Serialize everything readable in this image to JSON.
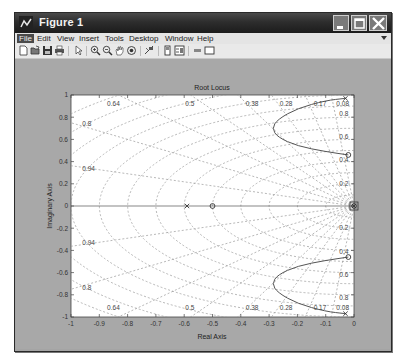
{
  "window": {
    "title": "Figure 1",
    "controls": {
      "minimize": "minimize-icon",
      "maximize": "maximize-icon",
      "close": "close-icon"
    }
  },
  "menubar": {
    "items": [
      {
        "label": "File"
      },
      {
        "label": "Edit"
      },
      {
        "label": "View"
      },
      {
        "label": "Insert"
      },
      {
        "label": "Tools"
      },
      {
        "label": "Desktop"
      },
      {
        "label": "Window"
      },
      {
        "label": "Help"
      }
    ]
  },
  "toolbar": {
    "buttons": [
      "new-figure-icon",
      "open-file-icon",
      "save-icon",
      "print-icon",
      "edit-plot-arrow-icon",
      "zoom-in-icon",
      "zoom-out-icon",
      "pan-hand-icon",
      "rotate-3d-icon",
      "data-cursor-icon",
      "colorbar-icon",
      "legend-icon",
      "hide-plot-tools-icon",
      "show-plot-tools-icon"
    ]
  },
  "chart_data": {
    "type": "scatter",
    "title": "Root Locus",
    "xlabel": "Real Axis",
    "ylabel": "Imaginary Axis",
    "xlim": [
      -1,
      0
    ],
    "ylim": [
      -1,
      1
    ],
    "x_ticks": [
      "-1",
      "-0.9",
      "-0.8",
      "-0.7",
      "-0.6",
      "-0.5",
      "-0.4",
      "-0.3",
      "-0.2",
      "-0.1",
      "0"
    ],
    "y_ticks": [
      "1",
      "0.8",
      "0.6",
      "0.4",
      "0.2",
      "0",
      "-0.2",
      "-0.4",
      "-0.6",
      "-0.8",
      "-1"
    ],
    "grid": true,
    "damping_labels_top": [
      "0.64",
      "0.5",
      "0.38",
      "0.28",
      "0.17",
      "0.08"
    ],
    "damping_labels_bottom": [
      "0.64",
      "0.5",
      "0.38",
      "0.28",
      "0.17",
      "0.08"
    ],
    "damping_labels_left": [
      "0.8",
      "0.94",
      "-0.94",
      "0.8"
    ],
    "frequency_labels_right": [
      "0.8",
      "0.6",
      "0.4",
      "0.2",
      "0.2",
      "0.4",
      "0.6",
      "0.8"
    ],
    "poles": [
      {
        "re": -0.59,
        "im": 0
      },
      {
        "re": -0.03,
        "im": 0.97
      },
      {
        "re": -0.03,
        "im": -0.97
      },
      {
        "re": 0,
        "im": 0
      }
    ],
    "zeros": [
      {
        "re": -0.5,
        "im": 0
      },
      {
        "re": -0.02,
        "im": 0.46
      },
      {
        "re": -0.02,
        "im": -0.46
      },
      {
        "re": 0,
        "im": 0
      }
    ],
    "branches": [
      {
        "name": "upper",
        "points": [
          [
            -0.03,
            0.97
          ],
          [
            -0.1,
            0.95
          ],
          [
            -0.2,
            0.88
          ],
          [
            -0.27,
            0.78
          ],
          [
            -0.29,
            0.7
          ],
          [
            -0.27,
            0.62
          ],
          [
            -0.2,
            0.54
          ],
          [
            -0.1,
            0.49
          ],
          [
            -0.02,
            0.46
          ]
        ]
      },
      {
        "name": "lower",
        "points": [
          [
            -0.03,
            -0.97
          ],
          [
            -0.1,
            -0.95
          ],
          [
            -0.2,
            -0.88
          ],
          [
            -0.27,
            -0.78
          ],
          [
            -0.29,
            -0.7
          ],
          [
            -0.27,
            -0.62
          ],
          [
            -0.2,
            -0.54
          ],
          [
            -0.1,
            -0.49
          ],
          [
            -0.02,
            -0.46
          ]
        ]
      },
      {
        "name": "real",
        "points": [
          [
            -1,
            0
          ],
          [
            0,
            0
          ]
        ]
      }
    ]
  }
}
